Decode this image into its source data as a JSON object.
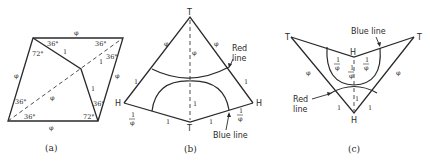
{
  "figure_a": {
    "caption": "(a)",
    "edge_labels": {
      "top": "φ",
      "left": "φ",
      "right": "φ",
      "bottom": "φ",
      "diagonal": "φ"
    },
    "inner_labels": {
      "upper_segment": "1",
      "lower_segment": "1",
      "diag_upper": "1"
    },
    "angles": {
      "top_left_upper": "36°",
      "top_left_lower": "72°",
      "top_right_upper": "36°",
      "top_right_lower": "36°",
      "bottom_left_upper": "36°",
      "bottom_left_lower": "36°",
      "bottom_right_upper": "36°",
      "bottom_right_lower": "72°"
    }
  },
  "figure_b": {
    "caption": "(b)",
    "vertex_top": "T",
    "vertex_bottom": "T",
    "vertex_left": "H",
    "vertex_right": "H",
    "upper_left_edge": "φ",
    "upper_right_edge": "φ",
    "center_upper": "φ",
    "left_mid": "1",
    "right_mid": "1",
    "center_lower": "1",
    "bottom_left_edge": "1",
    "bottom_right_edge": "1",
    "left_frac_num": "1",
    "left_frac_den": "φ",
    "right_frac_num": "1",
    "right_frac_den": "φ",
    "red_line_label_1": "Red",
    "red_line_label_2": "line",
    "blue_line_label": "Blue line"
  },
  "figure_c": {
    "caption": "(c)",
    "vertex_left": "T",
    "vertex_right": "T",
    "vertex_center": "H",
    "vertex_bottom": "H",
    "left_edge": "φ",
    "right_edge": "φ",
    "frac_left_num": "1",
    "frac_left_den": "φ",
    "frac_right_num": "1",
    "frac_right_den": "φ",
    "frac_center_num": "1",
    "frac_center_den": "φ",
    "lower_left": "1",
    "lower_right": "1",
    "lower_center": "1",
    "blue_line_label": "Blue line",
    "red_line_label_1": "Red",
    "red_line_label_2": "line"
  }
}
